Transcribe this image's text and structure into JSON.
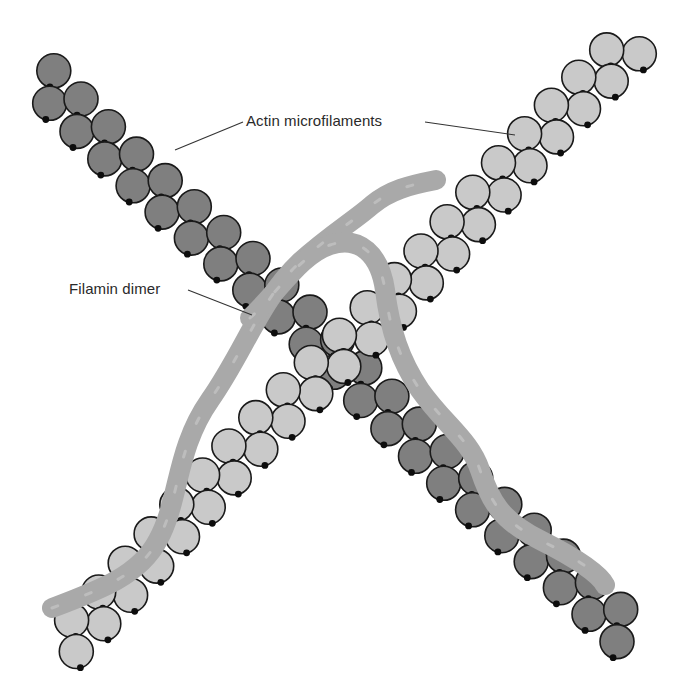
{
  "figure": {
    "labels": {
      "actin": "Actin microfilaments",
      "filamin": "Filamin dimer"
    }
  },
  "colors": {
    "dark_actin": "#7f7f7f",
    "light_actin": "#c9c9c9",
    "filamin": "#a9a9a9",
    "outline": "#1a1a1a",
    "binding_dot": "#0d0d0d",
    "text": "#2a2a2a",
    "background": "#ffffff"
  },
  "filaments": [
    {
      "name": "dark-actin-filament",
      "from": [
        45,
        80
      ],
      "to": [
        630,
        640
      ],
      "fill": "#7f7f7f",
      "monomer_radius": 17
    },
    {
      "name": "light-actin-filament",
      "from": [
        630,
        45
      ],
      "to": [
        62,
        645
      ],
      "fill": "#c9c9c9",
      "monomer_radius": 17
    }
  ],
  "filamin_strands": [
    {
      "name": "filamin-strand-1",
      "path": "M 52 608 C 100 590, 140 575, 158 540 C 180 500, 175 450, 210 400 C 245 350, 260 300, 300 262 C 330 235, 355 220, 372 205 C 390 190, 410 185, 436 180"
    },
    {
      "name": "filamin-strand-2",
      "path": "M 250 318 C 280 290, 300 255, 330 245 C 360 235, 380 255, 385 290 C 390 330, 400 360, 420 390 C 445 425, 470 440, 480 470 C 490 500, 500 520, 540 540 C 580 560, 600 575, 605 585"
    }
  ],
  "leaders": [
    {
      "name": "actin-leader-left",
      "points": "243,122 175,150"
    },
    {
      "name": "actin-leader-right",
      "points": "425,122 515,135"
    },
    {
      "name": "filamin-leader",
      "points": "188,290 252,315"
    }
  ]
}
